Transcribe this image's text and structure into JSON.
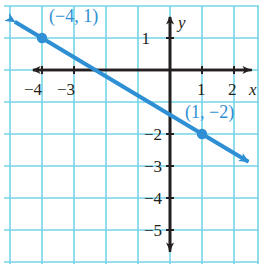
{
  "chart_data": {
    "type": "line",
    "title": "",
    "subtitle": "",
    "xlabel": "x",
    "ylabel": "y",
    "xlim": [
      -5,
      3
    ],
    "ylim": [
      -6,
      2
    ],
    "grid": true,
    "legend": false,
    "x_ticks": [
      {
        "value": -4,
        "label": "−4"
      },
      {
        "value": -3,
        "label": "−3"
      },
      {
        "value": 1,
        "label": "1"
      },
      {
        "value": 2,
        "label": "2"
      }
    ],
    "y_ticks": [
      {
        "value": 1,
        "label": "1"
      },
      {
        "value": -2,
        "label": "−2"
      },
      {
        "value": -3,
        "label": "−3"
      },
      {
        "value": -4,
        "label": "−4"
      },
      {
        "value": -5,
        "label": "−5"
      }
    ],
    "series": [
      {
        "name": "line",
        "type": "line",
        "color": "#2e8fd4",
        "slope": -0.6,
        "intercept": -1.4,
        "arrows": "both",
        "points": [
          {
            "x": -4,
            "y": 1,
            "label": "(−4, 1)"
          },
          {
            "x": 1,
            "y": -2,
            "label": "(1, −2)"
          }
        ]
      }
    ],
    "annotations": [
      {
        "text": "(−4, 1)",
        "x": -3.1,
        "y": 1.72,
        "color": "#2e8fd4"
      },
      {
        "text": "(1, −2)",
        "x": 0.1,
        "y": -1.0,
        "color": "#2e8fd4"
      }
    ],
    "colors": {
      "grid": "#74d4e6",
      "axis": "#231f20",
      "line": "#2e8fd4",
      "point": "#2e8fd4",
      "background": "#ffffff"
    }
  },
  "axes": {
    "x_axis_name": "x",
    "y_axis_name": "y"
  },
  "ticks": {
    "x": {
      "neg4": "−4",
      "neg3": "−3",
      "pos1": "1",
      "pos2": "2"
    },
    "y": {
      "pos1": "1",
      "neg2": "−2",
      "neg3": "−3",
      "neg4": "−4",
      "neg5": "−5"
    }
  },
  "labels": {
    "point_a": "(−4, 1)",
    "point_b": "(1, −2)"
  }
}
